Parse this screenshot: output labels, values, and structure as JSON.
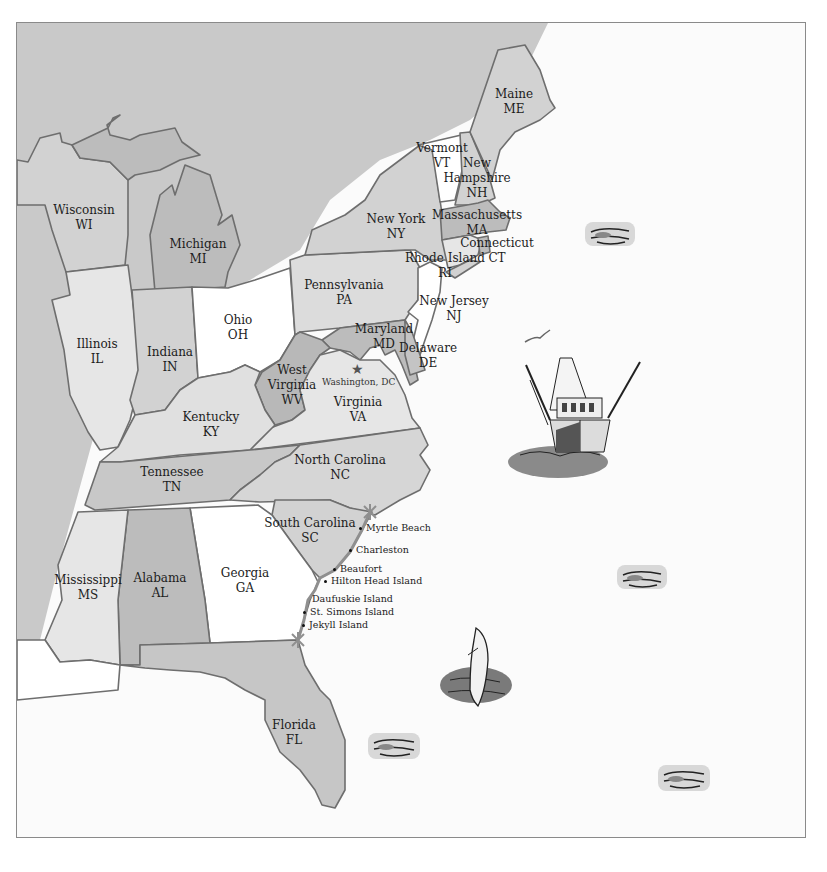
{
  "map": {
    "title": "",
    "colors": {
      "land_outside": "#c9c9c9",
      "ocean": "#fbfbfb",
      "border": "#6e6e6e",
      "coast_route": "#8f8f8f",
      "white_state": "#ffffff",
      "light_state": "#e6e6e6",
      "mid_state": "#d2d2d2",
      "dark_state": "#b8b8b8"
    },
    "states": [
      {
        "id": "WI",
        "name": "Wisconsin",
        "abbr": "WI"
      },
      {
        "id": "MI",
        "name": "Michigan",
        "abbr": "MI"
      },
      {
        "id": "IL",
        "name": "Illinois",
        "abbr": "IL"
      },
      {
        "id": "IN",
        "name": "Indiana",
        "abbr": "IN"
      },
      {
        "id": "OH",
        "name": "Ohio",
        "abbr": "OH"
      },
      {
        "id": "PA",
        "name": "Pennsylvania",
        "abbr": "PA"
      },
      {
        "id": "NY",
        "name": "New York",
        "abbr": "NY"
      },
      {
        "id": "VT",
        "name": "Vermont",
        "abbr": "VT"
      },
      {
        "id": "NH",
        "name": "New Hampshire",
        "abbr": "NH",
        "name_line1": "New",
        "name_line2": "Hampshire"
      },
      {
        "id": "ME",
        "name": "Maine",
        "abbr": "ME"
      },
      {
        "id": "MA",
        "name": "Massachusetts",
        "abbr": "MA"
      },
      {
        "id": "CT",
        "name": "Connecticut",
        "abbr": "CT"
      },
      {
        "id": "RI",
        "name": "Rhode Island",
        "abbr": "RI"
      },
      {
        "id": "NJ",
        "name": "New Jersey",
        "abbr": "NJ"
      },
      {
        "id": "MD",
        "name": "Maryland",
        "abbr": "MD"
      },
      {
        "id": "DE",
        "name": "Delaware",
        "abbr": "DE"
      },
      {
        "id": "WV",
        "name": "West Virginia",
        "abbr": "WV",
        "name_line1": "West",
        "name_line2": "Virginia"
      },
      {
        "id": "VA",
        "name": "Virginia",
        "abbr": "VA"
      },
      {
        "id": "KY",
        "name": "Kentucky",
        "abbr": "KY"
      },
      {
        "id": "TN",
        "name": "Tennessee",
        "abbr": "TN"
      },
      {
        "id": "NC",
        "name": "North Carolina",
        "abbr": "NC"
      },
      {
        "id": "SC",
        "name": "South Carolina",
        "abbr": "SC"
      },
      {
        "id": "GA",
        "name": "Georgia",
        "abbr": "GA"
      },
      {
        "id": "AL",
        "name": "Alabama",
        "abbr": "AL"
      },
      {
        "id": "MS",
        "name": "Mississippi",
        "abbr": "MS"
      },
      {
        "id": "FL",
        "name": "Florida",
        "abbr": "FL"
      }
    ],
    "capital": {
      "label": "Washington, DC",
      "icon": "star-icon"
    },
    "coastal_places": [
      "Myrtle Beach",
      "Charleston",
      "Beaufort",
      "Hilton Head Island",
      "Daufuskie Island",
      "St. Simons Island",
      "Jekyll Island"
    ],
    "route_markers": [
      "asterisk-marker-north",
      "asterisk-marker-south"
    ],
    "decorations": [
      "wave-icon",
      "wave-icon",
      "wave-icon",
      "wave-icon",
      "fishing-boat-icon",
      "seagull-icon",
      "dolphin-icon"
    ]
  }
}
